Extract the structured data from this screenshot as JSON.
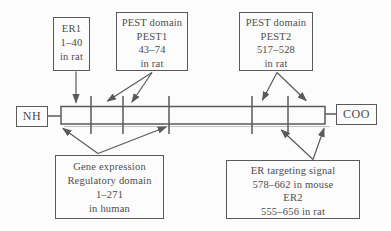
{
  "figure": {
    "type": "protein-domain-map",
    "colors": {
      "background": "#fcfcfc",
      "line": "#5a5a5a",
      "text": "#4c4c4c"
    },
    "termini": {
      "n_terminus": "NH",
      "c_terminus": "COO"
    },
    "boxes": {
      "er1": {
        "lines": [
          "ER1",
          "1–40",
          "in rat"
        ]
      },
      "pest1": {
        "lines": [
          "PEST domain",
          "PEST1",
          "43–74",
          "in rat"
        ]
      },
      "pest2": {
        "lines": [
          "PEST domain",
          "PEST2",
          "517–528",
          "in rat"
        ]
      },
      "gene_expression": {
        "lines": [
          "Gene expression",
          "Regulatory domain",
          "1–271",
          "in human"
        ]
      },
      "er_targeting": {
        "lines": [
          "ER targeting signal",
          "578–662 in mouse",
          "ER2",
          "555–656 in rat"
        ]
      }
    }
  }
}
